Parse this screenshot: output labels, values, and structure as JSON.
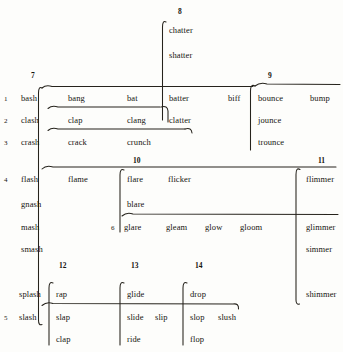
{
  "figure": {
    "title": "",
    "background_color": "#fdfdfb",
    "ink_color": "#26231c"
  },
  "column_numbers": [
    {
      "label": "7",
      "x": 31,
      "y": 72
    },
    {
      "label": "8",
      "x": 178,
      "y": 8
    },
    {
      "label": "9",
      "x": 268,
      "y": 72
    },
    {
      "label": "10",
      "x": 133,
      "y": 157
    },
    {
      "label": "11",
      "x": 318,
      "y": 157
    },
    {
      "label": "12",
      "x": 59,
      "y": 262
    },
    {
      "label": "13",
      "x": 131,
      "y": 262
    },
    {
      "label": "14",
      "x": 195,
      "y": 262
    }
  ],
  "row_numbers": [
    {
      "label": "1",
      "x": 4,
      "y": 95
    },
    {
      "label": "2",
      "x": 4,
      "y": 117
    },
    {
      "label": "3",
      "x": 4,
      "y": 139
    },
    {
      "label": "4",
      "x": 4,
      "y": 176
    },
    {
      "label": "6",
      "x": 111,
      "y": 224
    },
    {
      "label": "5",
      "x": 4,
      "y": 314
    }
  ],
  "words": [
    {
      "text": "chatter",
      "x": 169,
      "y": 25,
      "group": "col8"
    },
    {
      "text": "shatter",
      "x": 169,
      "y": 50,
      "group": "col8"
    },
    {
      "text": "bash",
      "x": 21,
      "y": 93,
      "group": "row1"
    },
    {
      "text": "bang",
      "x": 68,
      "y": 93,
      "group": "row1"
    },
    {
      "text": "bat",
      "x": 127,
      "y": 93,
      "group": "row1"
    },
    {
      "text": "batter",
      "x": 169,
      "y": 93,
      "group": "row1"
    },
    {
      "text": "biff",
      "x": 228,
      "y": 93,
      "group": "row1"
    },
    {
      "text": "bounce",
      "x": 258,
      "y": 93,
      "group": "row1"
    },
    {
      "text": "bump",
      "x": 310,
      "y": 93,
      "group": "row1"
    },
    {
      "text": "clash",
      "x": 21,
      "y": 115,
      "group": "row2"
    },
    {
      "text": "clap",
      "x": 68,
      "y": 115,
      "group": "row2"
    },
    {
      "text": "clang",
      "x": 127,
      "y": 115,
      "group": "row2"
    },
    {
      "text": "clatter",
      "x": 169,
      "y": 115,
      "group": "row2"
    },
    {
      "text": "jounce",
      "x": 258,
      "y": 115,
      "group": "row2"
    },
    {
      "text": "crash",
      "x": 21,
      "y": 137,
      "group": "row3"
    },
    {
      "text": "crack",
      "x": 68,
      "y": 137,
      "group": "row3"
    },
    {
      "text": "crunch",
      "x": 127,
      "y": 137,
      "group": "row3"
    },
    {
      "text": "trounce",
      "x": 258,
      "y": 137,
      "group": "row3"
    },
    {
      "text": "flash",
      "x": 21,
      "y": 174,
      "group": "row4"
    },
    {
      "text": "flame",
      "x": 68,
      "y": 174,
      "group": "row4"
    },
    {
      "text": "flare",
      "x": 127,
      "y": 174,
      "group": "row4"
    },
    {
      "text": "flicker",
      "x": 168,
      "y": 174,
      "group": "row4"
    },
    {
      "text": "flimmer",
      "x": 306,
      "y": 174,
      "group": "row4"
    },
    {
      "text": "gnash",
      "x": 21,
      "y": 199,
      "group": "col7-extra"
    },
    {
      "text": "blare",
      "x": 127,
      "y": 199,
      "group": "col10-extra"
    },
    {
      "text": "mash",
      "x": 21,
      "y": 222,
      "group": "row6"
    },
    {
      "text": "glare",
      "x": 124,
      "y": 222,
      "group": "row6"
    },
    {
      "text": "gleam",
      "x": 166,
      "y": 222,
      "group": "row6"
    },
    {
      "text": "glow",
      "x": 205,
      "y": 222,
      "group": "row6"
    },
    {
      "text": "gloom",
      "x": 240,
      "y": 222,
      "group": "row6"
    },
    {
      "text": "glimmer",
      "x": 306,
      "y": 222,
      "group": "row6"
    },
    {
      "text": "smash",
      "x": 21,
      "y": 244,
      "group": "col7-extra"
    },
    {
      "text": "simmer",
      "x": 306,
      "y": 244,
      "group": "col11-extra"
    },
    {
      "text": "splash",
      "x": 19,
      "y": 289,
      "group": "col7-extra"
    },
    {
      "text": "rap",
      "x": 56,
      "y": 289,
      "group": "col12"
    },
    {
      "text": "glide",
      "x": 127,
      "y": 289,
      "group": "col13"
    },
    {
      "text": "drop",
      "x": 190,
      "y": 289,
      "group": "col14"
    },
    {
      "text": "shimmer",
      "x": 306,
      "y": 289,
      "group": "col11-extra"
    },
    {
      "text": "slash",
      "x": 19,
      "y": 312,
      "group": "row5"
    },
    {
      "text": "slap",
      "x": 56,
      "y": 312,
      "group": "row5"
    },
    {
      "text": "slide",
      "x": 127,
      "y": 312,
      "group": "row5"
    },
    {
      "text": "slip",
      "x": 155,
      "y": 312,
      "group": "row5"
    },
    {
      "text": "slop",
      "x": 190,
      "y": 312,
      "group": "row5"
    },
    {
      "text": "slush",
      "x": 218,
      "y": 312,
      "group": "row5"
    },
    {
      "text": "clap",
      "x": 56,
      "y": 334,
      "group": "col12"
    },
    {
      "text": "ride",
      "x": 127,
      "y": 334,
      "group": "col13"
    },
    {
      "text": "flop",
      "x": 190,
      "y": 334,
      "group": "col14"
    }
  ],
  "brackets": {
    "col8_vertical": "M 166 22 q -3.5 -2 -3.5 5 L 162.5 120",
    "col7_vertical": "M 42 88 q -3.5 -2 -3.5 5 L 38.5 320 q 0 6 3.5 4.5",
    "row1_top": "M 42 88 q 4 -3.5 10 -1.5 L 162 86.5",
    "row1_right": "M 163 86.5 L 253 86.5",
    "row2_top": "M 48 108.5 q 4 -3.5 10 -1.5 L 160 107",
    "row3_top": "M 48 130.5 q 4 -3.5 10 -1.5 L 185 129",
    "row2_clatter": "M 161 107 q 6.5 -2 7 4 L 168 122",
    "row3_hook": "M 185 129 q 6.5 -2 7 4",
    "col9_vertical": "M 255 86 q -4.5 -2.5 -4.5 5 L 250.5 150",
    "col9_top": "M 255 86 q 5 -4 12 -2 L 340 84.5",
    "row4_top": "M 42 169 q 4 -4 11 -2 L 336 167",
    "col10_vertical": "M 124 170 q -4 -2 -4 5 L 120 232",
    "col10_top": "M 124 170 q 0 0 0 0",
    "row6_top": "M 122 216 q 4.5 -4 11 -2 L 338 214.5",
    "col11_vertical": "M 300 169.5 q -4 -2.5 -4 5 L 296 300 q 0 5 3.5 4",
    "col12_vertical": "M 53 283 q -4 -2 -4 5 L 49 345",
    "col13_vertical": "M 124 283 q -4 -2 -4 5 L 120 345",
    "col14_vertical": "M 187 283 q -4 -2 -4 5 L 183 345",
    "row5_line": "M 42 305.5 q 4.5 -4 11 -2 L 233 304 q 6 -1 5.5 5"
  }
}
